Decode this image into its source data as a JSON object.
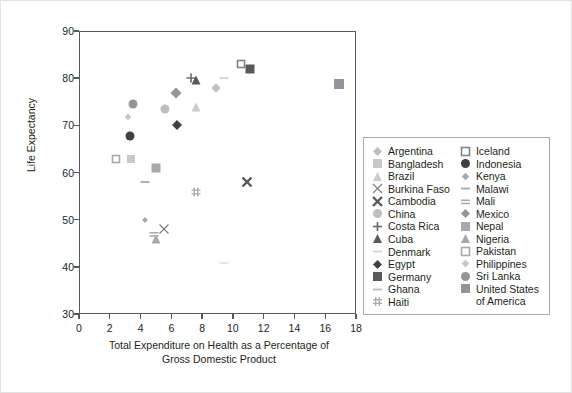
{
  "chart_data": {
    "type": "scatter",
    "title": "",
    "xlabel": "Total Expenditure on Health as a Percentage of Gross Domestic Product",
    "xlabel_line1": "Total Expenditure on Health as a Percentage of",
    "xlabel_line2": "Gross Domestic Product",
    "ylabel": "Life Expectancy",
    "xlim": [
      0,
      18
    ],
    "ylim": [
      30,
      90
    ],
    "xticks": [
      0,
      2,
      4,
      6,
      8,
      10,
      12,
      14,
      16,
      18
    ],
    "yticks": [
      30,
      40,
      50,
      60,
      70,
      80,
      90
    ],
    "grid": false,
    "legend_position": "right-outside",
    "points": [
      {
        "name": "Argentina",
        "x": 8.9,
        "y": 77.9,
        "marker": "diamond",
        "color": "#bcbec0",
        "size": 9
      },
      {
        "name": "Bangladesh",
        "x": 3.4,
        "y": 62.8,
        "marker": "square",
        "color": "#c7c8ca",
        "size": 8
      },
      {
        "name": "Brazil",
        "x": 7.6,
        "y": 73.9,
        "marker": "triangle",
        "color": "#cacbcd",
        "size": 9
      },
      {
        "name": "Burkina Faso",
        "x": 5.5,
        "y": 48.0,
        "marker": "x-thin",
        "color": "#808285",
        "size": 9
      },
      {
        "name": "Cambodia",
        "x": 10.9,
        "y": 57.9,
        "marker": "x-bold",
        "color": "#58595b",
        "size": 9
      },
      {
        "name": "China",
        "x": 5.6,
        "y": 73.5,
        "marker": "circle",
        "color": "#bcbec0",
        "size": 9
      },
      {
        "name": "Costa Rica",
        "x": 7.3,
        "y": 80.0,
        "marker": "plus",
        "color": "#6d6e71",
        "size": 9
      },
      {
        "name": "Cuba",
        "x": 7.6,
        "y": 79.7,
        "marker": "triangle",
        "color": "#58595b",
        "size": 9
      },
      {
        "name": "Denmark",
        "x": 9.4,
        "y": 80.1,
        "marker": "dash",
        "color": "#d0d2d3",
        "size": 9
      },
      {
        "name": "Egypt",
        "x": 6.4,
        "y": 70.0,
        "marker": "diamond",
        "color": "#414042",
        "size": 10
      },
      {
        "name": "Germany",
        "x": 11.1,
        "y": 81.9,
        "marker": "square",
        "color": "#58595b",
        "size": 9
      },
      {
        "name": "Ghana",
        "x": 9.4,
        "y": 40.8,
        "marker": "dash",
        "color": "#e3e4e5",
        "size": 9
      },
      {
        "name": "Haiti",
        "x": 7.6,
        "y": 55.8,
        "marker": "hash",
        "color": "#a7a9ac",
        "size": 9
      },
      {
        "name": "Iceland",
        "x": 10.5,
        "y": 83.0,
        "marker": "open-square",
        "color": "#808285",
        "size": 8
      },
      {
        "name": "Indonesia",
        "x": 3.3,
        "y": 67.7,
        "marker": "circle",
        "color": "#414042",
        "size": 9
      },
      {
        "name": "Kenya",
        "x": 4.3,
        "y": 50.0,
        "marker": "diamond-sm",
        "color": "#a7a9ac",
        "size": 7
      },
      {
        "name": "Malawi",
        "x": 4.3,
        "y": 57.9,
        "marker": "dash",
        "color": "#a7a9ac",
        "size": 9
      },
      {
        "name": "Mali",
        "x": 4.9,
        "y": 47.0,
        "marker": "double-dash",
        "color": "#a7a9ac",
        "size": 9
      },
      {
        "name": "Mexico",
        "x": 6.3,
        "y": 76.9,
        "marker": "diamond",
        "color": "#939598",
        "size": 11
      },
      {
        "name": "Nepal",
        "x": 5.0,
        "y": 61.0,
        "marker": "square",
        "color": "#a7a9ac",
        "size": 9
      },
      {
        "name": "Nigeria",
        "x": 5.0,
        "y": 45.8,
        "marker": "triangle",
        "color": "#a7a9ac",
        "size": 9
      },
      {
        "name": "Pakistan",
        "x": 2.4,
        "y": 62.8,
        "marker": "open-square",
        "color": "#a7a9ac",
        "size": 8
      },
      {
        "name": "Philippines",
        "x": 3.2,
        "y": 71.8,
        "marker": "diamond-sm",
        "color": "#c7c8ca",
        "size": 8
      },
      {
        "name": "Sri Lanka",
        "x": 3.5,
        "y": 74.6,
        "marker": "circle",
        "color": "#939598",
        "size": 9
      },
      {
        "name": "United States of America",
        "x": 16.9,
        "y": 78.8,
        "marker": "square",
        "color": "#939598",
        "size": 10
      }
    ]
  },
  "legend": {
    "column_left": [
      {
        "label": "Argentina",
        "marker": "diamond",
        "color": "#bcbec0"
      },
      {
        "label": "Bangladesh",
        "marker": "square",
        "color": "#c7c8ca"
      },
      {
        "label": "Brazil",
        "marker": "triangle",
        "color": "#cacbcd"
      },
      {
        "label": "Burkina Faso",
        "marker": "x-thin",
        "color": "#808285"
      },
      {
        "label": "Cambodia",
        "marker": "x-bold",
        "color": "#58595b"
      },
      {
        "label": "China",
        "marker": "circle",
        "color": "#bcbec0"
      },
      {
        "label": "Costa Rica",
        "marker": "plus",
        "color": "#6d6e71"
      },
      {
        "label": "Cuba",
        "marker": "triangle",
        "color": "#58595b"
      },
      {
        "label": "Denmark",
        "marker": "dash",
        "color": "#d0d2d3"
      },
      {
        "label": "Egypt",
        "marker": "diamond",
        "color": "#414042"
      },
      {
        "label": "Germany",
        "marker": "square",
        "color": "#58595b"
      },
      {
        "label": "Ghana",
        "marker": "dash",
        "color": "#bcbec0"
      },
      {
        "label": "Haiti",
        "marker": "hash",
        "color": "#a7a9ac"
      }
    ],
    "column_right": [
      {
        "label": "Iceland",
        "marker": "open-square",
        "color": "#808285"
      },
      {
        "label": "Indonesia",
        "marker": "circle",
        "color": "#414042"
      },
      {
        "label": "Kenya",
        "marker": "diamond-sm",
        "color": "#a7a9ac"
      },
      {
        "label": "Malawi",
        "marker": "dash",
        "color": "#a7a9ac"
      },
      {
        "label": "Mali",
        "marker": "double-dash",
        "color": "#a7a9ac"
      },
      {
        "label": "Mexico",
        "marker": "diamond",
        "color": "#939598"
      },
      {
        "label": "Nepal",
        "marker": "square",
        "color": "#a7a9ac"
      },
      {
        "label": "Nigeria",
        "marker": "triangle",
        "color": "#a7a9ac"
      },
      {
        "label": "Pakistan",
        "marker": "open-square",
        "color": "#a7a9ac"
      },
      {
        "label": "Philippines",
        "marker": "diamond-sm",
        "color": "#c7c8ca"
      },
      {
        "label": "Sri Lanka",
        "marker": "circle",
        "color": "#939598"
      },
      {
        "label": "United States",
        "marker": "square",
        "color": "#939598"
      }
    ],
    "continuation_line": "of America"
  },
  "colors": {
    "axis": "#58595b",
    "text": "#231f20",
    "legend_border": "#a7a9ac",
    "figure_border": "#e2e2e2",
    "background": "#ffffff"
  }
}
